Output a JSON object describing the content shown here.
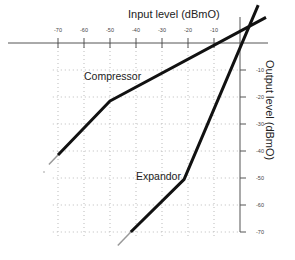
{
  "chart_data": {
    "type": "line",
    "title": "",
    "xlabel": "Input level (dBmO)",
    "ylabel": "Output level (dBmO)",
    "xlim": [
      -75,
      10
    ],
    "ylim": [
      -75,
      15
    ],
    "x_ticks": [
      -70,
      -60,
      -50,
      -40,
      -30,
      -20,
      -10
    ],
    "y_ticks": [
      -10,
      -20,
      -30,
      -40,
      -50,
      -60,
      -70
    ],
    "grid": true,
    "grid_style": "dotted",
    "legend": "none",
    "series": [
      {
        "name": "Compressor",
        "points": [
          [
            -70,
            -41.5
          ],
          [
            -50,
            -21.5
          ],
          [
            10,
            9.5
          ]
        ],
        "extension_grey": [
          [
            -70,
            -41.5
          ],
          [
            -73.5,
            -45
          ]
        ]
      },
      {
        "name": "Expandor",
        "points": [
          [
            -42,
            -70
          ],
          [
            -21.5,
            -50.5
          ],
          [
            7,
            14
          ]
        ],
        "extension_grey": [
          [
            -42,
            -70
          ],
          [
            -47,
            -75
          ]
        ]
      }
    ],
    "annotations": [
      {
        "text": "Compressor",
        "x": -60,
        "y": -13
      },
      {
        "text": "Expandor",
        "x": -40,
        "y": -50
      }
    ]
  }
}
